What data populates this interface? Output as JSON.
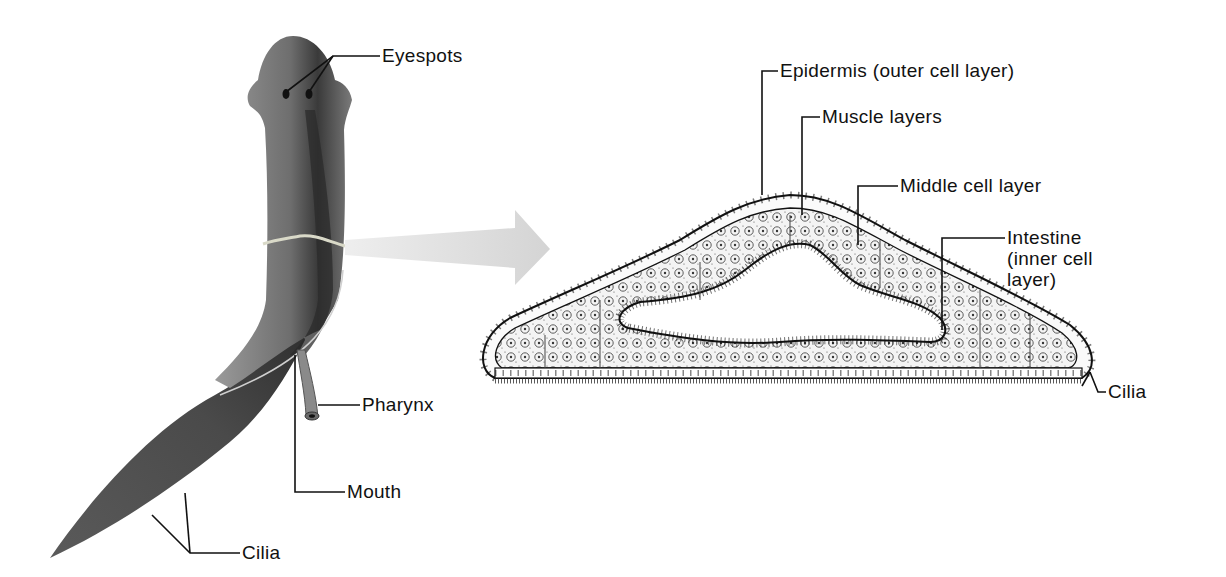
{
  "figure": {
    "left_panel": {
      "subject": "flatworm (planarian) whole body",
      "labels": [
        {
          "id": "eyespots",
          "text": "Eyespots"
        },
        {
          "id": "pharynx",
          "text": "Pharynx"
        },
        {
          "id": "mouth",
          "text": "Mouth"
        },
        {
          "id": "cilia",
          "text": "Cilia"
        }
      ]
    },
    "arrow": {
      "meaning": "cross-section location",
      "color": "#d9d9d9"
    },
    "right_panel": {
      "subject": "cross section of flatworm body",
      "labels": [
        {
          "id": "epidermis",
          "text": "Epidermis (outer cell layer)"
        },
        {
          "id": "muscle",
          "text": "Muscle layers"
        },
        {
          "id": "middle",
          "text": "Middle cell layer"
        },
        {
          "id": "intestine",
          "text": "Intestine (inner cell layer)"
        },
        {
          "id": "cilia",
          "text": "Cilia"
        }
      ]
    },
    "colors": {
      "worm_light": "#8a8a8a",
      "worm_dark": "#3a3a3a",
      "line": "#111111",
      "tissue": "#eeeeee"
    }
  }
}
